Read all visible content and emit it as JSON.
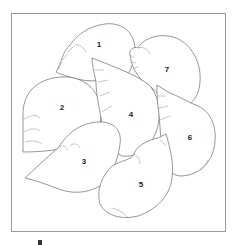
{
  "figure": {
    "type": "line-drawing",
    "border_color": "#9a9a9a",
    "stroke_color": "#6a6a6a",
    "background": "#ffffff"
  },
  "shells": [
    {
      "id": 1,
      "label": "1",
      "x": 99,
      "y": 45
    },
    {
      "id": 2,
      "label": "2",
      "x": 62,
      "y": 108
    },
    {
      "id": 3,
      "label": "3",
      "x": 84,
      "y": 162
    },
    {
      "id": 4,
      "label": "4",
      "x": 131,
      "y": 115
    },
    {
      "id": 5,
      "label": "5",
      "x": 141,
      "y": 185
    },
    {
      "id": 6,
      "label": "6",
      "x": 190,
      "y": 138
    },
    {
      "id": 7,
      "label": "7",
      "x": 167,
      "y": 70
    }
  ]
}
